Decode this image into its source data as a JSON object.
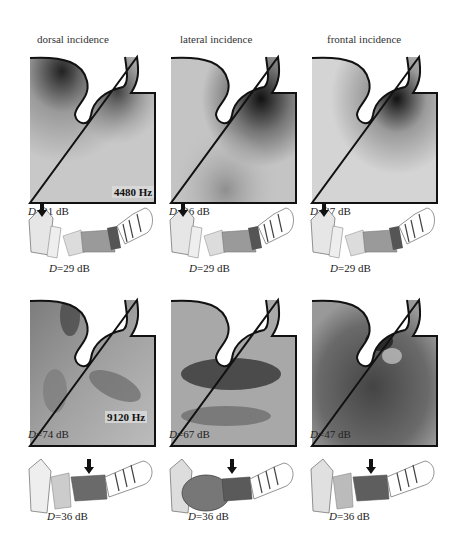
{
  "columns": [
    {
      "header": "dorsal incidence"
    },
    {
      "header": "lateral incidence"
    },
    {
      "header": "frontal incidence"
    }
  ],
  "rows": [
    {
      "frequency_label": "4480 Hz",
      "pressure_maps": [
        {
          "D_prefix": "D",
          "D_value": "=31 dB"
        },
        {
          "D_prefix": "D",
          "D_value": "=36 dB"
        },
        {
          "D_prefix": "D",
          "D_value": "=47 dB"
        }
      ],
      "tract_models": [
        {
          "D_prefix": "D",
          "D_value": "=29 dB"
        },
        {
          "D_prefix": "D",
          "D_value": "=29 dB"
        },
        {
          "D_prefix": "D",
          "D_value": "=29 dB"
        }
      ]
    },
    {
      "frequency_label": "9120 Hz",
      "pressure_maps": [
        {
          "D_prefix": "D",
          "D_value": "=74 dB"
        },
        {
          "D_prefix": "D",
          "D_value": "=67 dB"
        },
        {
          "D_prefix": "D",
          "D_value": "=47 dB"
        }
      ],
      "tract_models": [
        {
          "D_prefix": "D",
          "D_value": "=36 dB"
        },
        {
          "D_prefix": "D",
          "D_value": "=36 dB"
        },
        {
          "D_prefix": "D",
          "D_value": "=36 dB"
        }
      ]
    }
  ],
  "colors": {
    "outline": "#111111",
    "dark": "#2a2a2a",
    "light": "#d8d8d8"
  }
}
